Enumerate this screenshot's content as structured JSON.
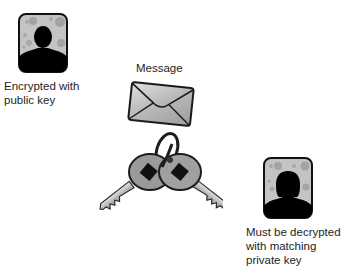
{
  "sender": {
    "icon": "male-user-avatar-icon",
    "caption": "Encrypted with\npublic key"
  },
  "message": {
    "label": "Message",
    "icon": "envelope-icon"
  },
  "keys": {
    "icon": "key-pair-icon"
  },
  "recipient": {
    "icon": "female-user-avatar-icon",
    "caption": "Must be decrypted\nwith matching\nprivate key"
  },
  "colors": {
    "frame_bg": "#c4c4c4",
    "silhouette": "#000000",
    "envelope_fill": "#bdbdbd",
    "key_fill": "#9a9a9a",
    "outline": "#222222"
  }
}
